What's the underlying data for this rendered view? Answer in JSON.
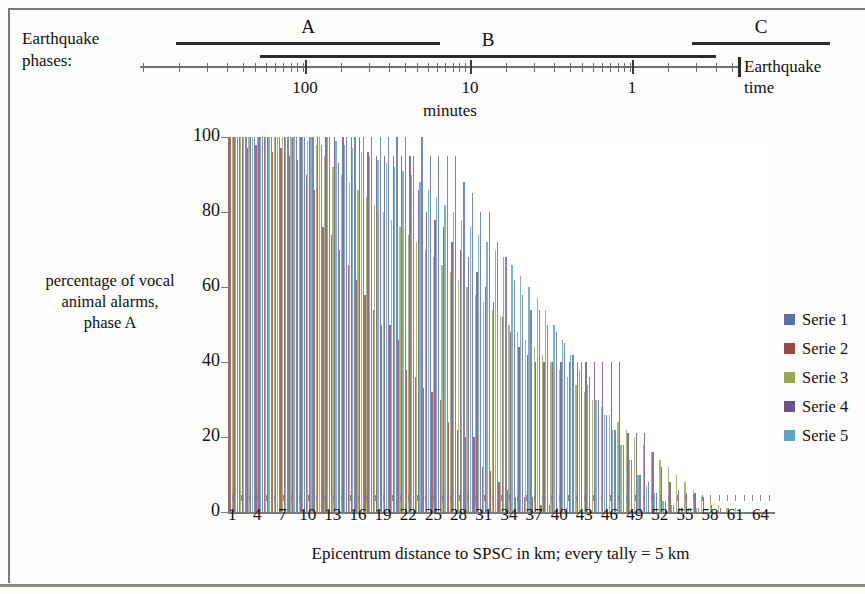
{
  "phases": {
    "section_label": "Earthquake\nphases:",
    "section_label_line1": "Earthquake",
    "section_label_line2": "phases:",
    "phase_markers": [
      {
        "letter": "A",
        "start_pct": 6,
        "end_pct": 50,
        "row": 0
      },
      {
        "letter": "B",
        "start_pct": 20,
        "end_pct": 96,
        "row": 1
      },
      {
        "letter": "C",
        "start_pct": 92,
        "end_pct": 115,
        "row": 0
      }
    ],
    "time_ticks": [
      {
        "label": "100",
        "pos_pct": 27.5
      },
      {
        "label": "10",
        "pos_pct": 55.0
      },
      {
        "label": "1",
        "pos_pct": 82.0
      }
    ],
    "axis_unit": "minutes",
    "end_label_line1": "Earthquake",
    "end_label_line2": "time"
  },
  "legend": {
    "position": "right",
    "items": [
      {
        "label": "Serie 1",
        "color": "#5a6fa8"
      },
      {
        "label": "Serie 2",
        "color": "#9c4a42"
      },
      {
        "label": "Serie 3",
        "color": "#97ab4e"
      },
      {
        "label": "Serie 4",
        "color": "#6d5289"
      },
      {
        "label": "Serie 5",
        "color": "#5fa4c4"
      }
    ]
  },
  "chart_data": {
    "type": "bar",
    "title": "",
    "subtitle": "",
    "xlabel": "Epicentrum distance to SPSC in km; every tally = 5 km",
    "ylabel": "percentage of vocal animal alarms, phase A",
    "ylabel_line1": "percentage of vocal",
    "ylabel_line2": "animal alarms,",
    "ylabel_line3": "phase A",
    "ylim": [
      0,
      100
    ],
    "yticks": [
      0,
      20,
      40,
      60,
      80,
      100
    ],
    "grid": true,
    "xtick_labels": [
      "1",
      "4",
      "7",
      "10",
      "13",
      "16",
      "19",
      "22",
      "25",
      "28",
      "31",
      "34",
      "37",
      "40",
      "43",
      "46",
      "49",
      "52",
      "55",
      "58",
      "61",
      "64"
    ],
    "xtick_step": 3,
    "categories": [
      1,
      2,
      3,
      4,
      5,
      6,
      7,
      8,
      9,
      10,
      11,
      12,
      13,
      14,
      15,
      16,
      17,
      18,
      19,
      20,
      21,
      22,
      23,
      24,
      25,
      26,
      27,
      28,
      29,
      30,
      31,
      32,
      33,
      34,
      35,
      36,
      37,
      38,
      39,
      40,
      41,
      42,
      43,
      44,
      45,
      46,
      47,
      48,
      49,
      50,
      51,
      52,
      53,
      54,
      55,
      56,
      57,
      58,
      59,
      60,
      61,
      62,
      63,
      64,
      65
    ],
    "series": [
      {
        "name": "Serie 1",
        "color": "#5a6fa8",
        "values": [
          100,
          100,
          100,
          100,
          100,
          100,
          100,
          100,
          100,
          100,
          100,
          98,
          100,
          93,
          100,
          100,
          100,
          100,
          100,
          100,
          100,
          100,
          95,
          100,
          95,
          95,
          95,
          95,
          88,
          85,
          80,
          80,
          72,
          68,
          62,
          58,
          54,
          54,
          50,
          48,
          45,
          42,
          40,
          36,
          30,
          26,
          22,
          18,
          14,
          10,
          8,
          5,
          3,
          2,
          1,
          1,
          1,
          0,
          0,
          0,
          0,
          0,
          0,
          0,
          0
        ]
      },
      {
        "name": "Serie 2",
        "color": "#9c4a42",
        "values": [
          100,
          100,
          97,
          98,
          100,
          96,
          97,
          95,
          94,
          90,
          86,
          76,
          74,
          70,
          66,
          62,
          58,
          54,
          50,
          50,
          46,
          38,
          36,
          33,
          32,
          30,
          24,
          22,
          20,
          20,
          12,
          11,
          8,
          6,
          4,
          4,
          4,
          2,
          2,
          1,
          1,
          0,
          0,
          0,
          0,
          0,
          0,
          0,
          0,
          0,
          0,
          0,
          0,
          0,
          0,
          0,
          0,
          0,
          0,
          0,
          0,
          0,
          0,
          0,
          0
        ]
      },
      {
        "name": "Serie 3",
        "color": "#97ab4e",
        "values": [
          100,
          100,
          100,
          100,
          100,
          100,
          100,
          100,
          100,
          99,
          98,
          95,
          92,
          90,
          88,
          86,
          84,
          82,
          80,
          78,
          76,
          74,
          72,
          70,
          68,
          66,
          64,
          62,
          60,
          58,
          56,
          54,
          52,
          50,
          48,
          46,
          44,
          42,
          40,
          38,
          36,
          34,
          32,
          30,
          28,
          26,
          24,
          22,
          20,
          18,
          16,
          14,
          12,
          10,
          8,
          6,
          4,
          3,
          2,
          1,
          1,
          0,
          0,
          0,
          0
        ]
      },
      {
        "name": "Serie 4",
        "color": "#6d5289",
        "values": [
          100,
          100,
          100,
          100,
          100,
          100,
          100,
          100,
          100,
          100,
          100,
          100,
          100,
          100,
          100,
          100,
          96,
          95,
          95,
          95,
          95,
          95,
          86,
          80,
          78,
          76,
          72,
          70,
          68,
          64,
          60,
          56,
          52,
          48,
          44,
          42,
          40,
          40,
          40,
          40,
          40,
          40,
          40,
          40,
          40,
          40,
          40,
          21,
          21,
          21,
          16,
          12,
          8,
          6,
          5,
          5,
          4,
          2,
          1,
          1,
          0,
          0,
          0,
          0,
          0
        ]
      },
      {
        "name": "Serie 5",
        "color": "#5fa4c4",
        "values": [
          100,
          100,
          100,
          100,
          100,
          100,
          100,
          100,
          100,
          100,
          100,
          100,
          99,
          98,
          97,
          96,
          95,
          94,
          93,
          92,
          91,
          90,
          88,
          86,
          84,
          82,
          80,
          78,
          76,
          74,
          72,
          70,
          68,
          66,
          63,
          60,
          57,
          54,
          50,
          46,
          42,
          38,
          34,
          30,
          26,
          22,
          18,
          14,
          10,
          7,
          5,
          3,
          2,
          1,
          1,
          1,
          0,
          0,
          0,
          0,
          0,
          0,
          0,
          0,
          0
        ]
      }
    ]
  }
}
